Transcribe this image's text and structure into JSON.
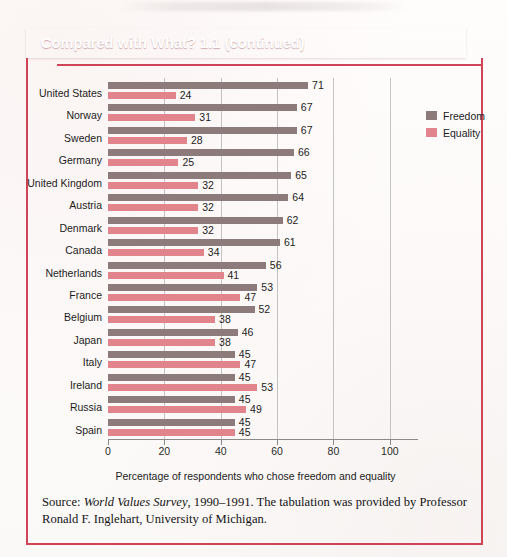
{
  "banner": {
    "title": "Compared with What? 1.1 (continued)",
    "color": "#cf4456"
  },
  "legend": {
    "items": [
      {
        "label": "Freedom",
        "color": "#8d7a7b"
      },
      {
        "label": "Equality",
        "color": "#e2848c"
      }
    ]
  },
  "axis_title": "Percentage of respondents who chose freedom and equality",
  "source": {
    "prefix": "Source: ",
    "italic": "World Values Survey",
    "rest": ", 1990–1991. The tabulation was provided by Professor Ronald F. Inglehart, University of Michigan."
  },
  "chart_data": {
    "type": "bar",
    "orientation": "horizontal",
    "title": "Compared with What? 1.1 (continued)",
    "xlabel": "Percentage of respondents who chose freedom and equality",
    "ylabel": "",
    "xlim": [
      0,
      110
    ],
    "xticks": [
      0,
      20,
      40,
      60,
      80,
      100
    ],
    "grid": true,
    "legend_position": "top-right",
    "categories": [
      "United States",
      "Norway",
      "Sweden",
      "Germany",
      "United Kingdom",
      "Austria",
      "Denmark",
      "Canada",
      "Netherlands",
      "France",
      "Belgium",
      "Japan",
      "Italy",
      "Ireland",
      "Russia",
      "Spain"
    ],
    "series": [
      {
        "name": "Freedom",
        "color": "#8d7a7b",
        "values": [
          71,
          67,
          67,
          66,
          65,
          64,
          62,
          61,
          56,
          53,
          52,
          46,
          45,
          45,
          45,
          45
        ]
      },
      {
        "name": "Equality",
        "color": "#e2848c",
        "values": [
          24,
          31,
          28,
          25,
          32,
          32,
          32,
          34,
          41,
          47,
          38,
          38,
          47,
          53,
          49,
          45
        ]
      }
    ]
  }
}
